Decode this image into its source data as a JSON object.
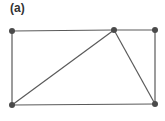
{
  "figure": {
    "label": "(a)",
    "edge_color": "#5a5a5a",
    "node_color": "#4a4a4a"
  },
  "graph": {
    "nodes": [
      {
        "id": "top-left"
      },
      {
        "id": "top-middle"
      },
      {
        "id": "top-right"
      },
      {
        "id": "bottom-left"
      },
      {
        "id": "bottom-right"
      }
    ],
    "edges": [
      [
        "top-left",
        "top-middle"
      ],
      [
        "top-middle",
        "top-right"
      ],
      [
        "top-left",
        "bottom-left"
      ],
      [
        "top-right",
        "bottom-right"
      ],
      [
        "bottom-left",
        "bottom-right"
      ],
      [
        "bottom-left",
        "top-middle"
      ],
      [
        "top-middle",
        "bottom-right"
      ]
    ]
  }
}
